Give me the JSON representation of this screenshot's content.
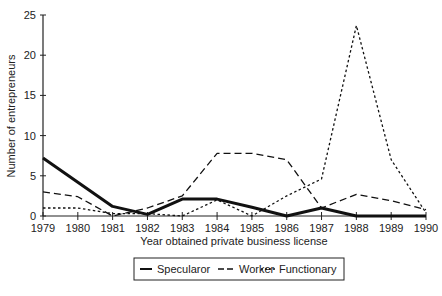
{
  "chart_data": {
    "type": "line",
    "title": "",
    "xlabel": "Year obtained private business license",
    "ylabel": "Number of entrepreneurs",
    "x": [
      1979,
      1980,
      1981,
      1982,
      1983,
      1984,
      1985,
      1986,
      1987,
      1988,
      1989,
      1990
    ],
    "x_tick_labels": [
      "1979",
      "1980",
      "1981",
      "1982",
      "1983",
      "1984",
      "1985",
      "1986",
      "1987",
      "1988",
      "1989",
      "1990"
    ],
    "ylim": [
      0,
      25
    ],
    "y_ticks": [
      0,
      5,
      10,
      15,
      20,
      25
    ],
    "y_tick_labels": [
      "0",
      "5",
      "10",
      "15",
      "20",
      "25"
    ],
    "grid": false,
    "legend_position": "bottom",
    "series": [
      {
        "name": "Specularor",
        "style": "solid",
        "values": [
          7.2,
          4.2,
          1.2,
          0.2,
          2.1,
          2.1,
          1.1,
          0,
          1,
          0,
          0,
          0
        ]
      },
      {
        "name": "Worker",
        "style": "dashed",
        "values": [
          3,
          2.4,
          0,
          1,
          2.5,
          7.8,
          7.8,
          7,
          1,
          2.7,
          1.9,
          0.8
        ]
      },
      {
        "name": "Functionary",
        "style": "dotted",
        "values": [
          1,
          1,
          0.3,
          0.3,
          0,
          2,
          0,
          2.5,
          4.6,
          23.7,
          7,
          0.4
        ]
      }
    ]
  }
}
